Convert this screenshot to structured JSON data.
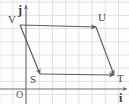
{
  "figure": {
    "width": 129,
    "height": 104,
    "background_color": "#fdfdfd",
    "grid": {
      "visible": true,
      "spacing_px": 13.2,
      "color": "#e2e2e6",
      "x_start": -0.3,
      "y_start": 2.2
    },
    "axes": {
      "color": "#6e6e72",
      "origin_px": {
        "x": 26,
        "y": 89
      },
      "x_axis": {
        "label": "i",
        "from_px": {
          "x": 0,
          "y": 89
        },
        "to_px": {
          "x": 129,
          "y": 89
        }
      },
      "y_axis": {
        "label": "j",
        "from_px": {
          "x": 26,
          "y": 104
        },
        "to_px": {
          "x": 26,
          "y": 5
        }
      },
      "origin_label": "O"
    },
    "shape": {
      "type": "parallelogram",
      "stroke_color": "#5c5c60",
      "vertices": [
        {
          "id": "V",
          "label": "V",
          "x": 20,
          "y": 25,
          "label_x": 8,
          "label_y": 23
        },
        {
          "id": "U",
          "label": "U",
          "x": 96,
          "y": 27,
          "label_x": 98,
          "label_y": 21
        },
        {
          "id": "T",
          "label": "T",
          "x": 114,
          "y": 75,
          "label_x": 117,
          "label_y": 82
        },
        {
          "id": "S",
          "label": "S",
          "x": 40,
          "y": 74,
          "label_x": 30,
          "label_y": 83
        }
      ],
      "vectors": [
        {
          "name": "V-to-U",
          "from": "V",
          "to": "U",
          "arrow": true
        },
        {
          "name": "V-to-S",
          "from": "V",
          "to": "S",
          "arrow": true
        },
        {
          "name": "U-to-T",
          "from": "U",
          "to": "T",
          "arrow": true
        },
        {
          "name": "S-to-T",
          "from": "S",
          "to": "T",
          "arrow": true
        }
      ]
    },
    "unit_vector_labels": {
      "i": "i",
      "j": "j"
    }
  }
}
